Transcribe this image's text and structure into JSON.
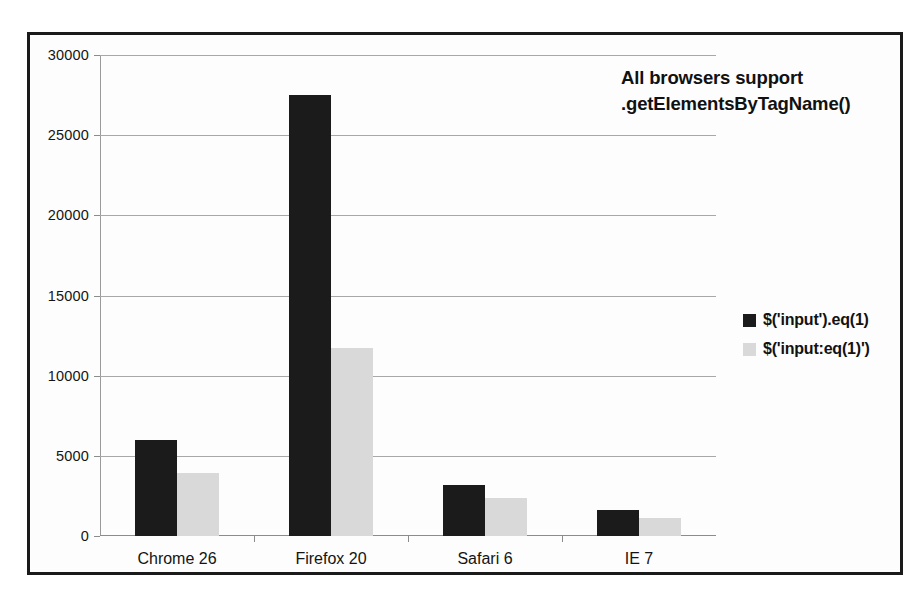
{
  "chart_data": {
    "type": "bar",
    "title": "",
    "xlabel": "",
    "ylabel": "",
    "categories": [
      "Chrome 26",
      "Firefox 20",
      "Safari 6",
      "IE 7"
    ],
    "series": [
      {
        "name": "$('input').eq(1)",
        "color": "#1b1b1b",
        "values": [
          6000,
          27500,
          3200,
          1600
        ]
      },
      {
        "name": "$('input:eq(1)')",
        "color": "#d9d9d9",
        "values": [
          3900,
          11700,
          2400,
          1100
        ]
      }
    ],
    "ylim": [
      0,
      30000
    ],
    "yticks": [
      0,
      5000,
      10000,
      15000,
      20000,
      25000,
      30000
    ],
    "ytick_labels": [
      "0",
      "5000",
      "10000",
      "15000",
      "20000",
      "25000",
      "30000"
    ],
    "grid": true,
    "legend_position": "right",
    "annotations": [
      {
        "line1": "All browsers support",
        "line2": ".getElementsByTagName()"
      }
    ]
  },
  "annotation": {
    "line1": "All browsers support",
    "line2": ".getElementsByTagName()"
  }
}
